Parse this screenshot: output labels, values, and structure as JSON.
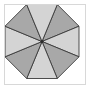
{
  "figure": {
    "canvas": {
      "width": 92,
      "height": 91,
      "background": "#ffffff"
    },
    "frame": {
      "label": "figure border",
      "x": 4,
      "y": 4,
      "width": 82,
      "height": 81,
      "stroke": "#d8d8d8",
      "fill": "#ffffff"
    },
    "palette": {
      "light_fill": "#d4d4d4",
      "dark_fill": "#a8a8a8",
      "outline": "#3a3a3a",
      "center_dot": "#2b2b2b",
      "frame_stroke": "#d8d8d8",
      "background": "#ffffff"
    },
    "shape": {
      "kind": "regular-octagon",
      "sides": 8,
      "center": {
        "x": 41,
        "y": 40.5
      },
      "radius": 40,
      "rotation_deg": 22.5,
      "vertices": [
        {
          "x": 56.3,
          "y": 3.5
        },
        {
          "x": 78.0,
          "y": 25.2
        },
        {
          "x": 78.0,
          "y": 55.8
        },
        {
          "x": 56.3,
          "y": 77.5
        },
        {
          "x": 25.7,
          "y": 77.5
        },
        {
          "x": 4.0,
          "y": 55.8
        },
        {
          "x": 4.0,
          "y": 25.2
        },
        {
          "x": 25.7,
          "y": 3.5
        }
      ],
      "center_dot_radius": 1.6
    },
    "wedges": [
      {
        "name": "wedge-top-right",
        "index": 0,
        "from_vertex": 0,
        "to_vertex": 1,
        "fill": "#a8a8a8",
        "tone": "dark"
      },
      {
        "name": "wedge-right-upper",
        "index": 1,
        "from_vertex": 1,
        "to_vertex": 2,
        "fill": "#d4d4d4",
        "tone": "light"
      },
      {
        "name": "wedge-right-lower",
        "index": 2,
        "from_vertex": 2,
        "to_vertex": 3,
        "fill": "#a8a8a8",
        "tone": "dark"
      },
      {
        "name": "wedge-bottom-right",
        "index": 3,
        "from_vertex": 3,
        "to_vertex": 4,
        "fill": "#d4d4d4",
        "tone": "light"
      },
      {
        "name": "wedge-bottom-left",
        "index": 4,
        "from_vertex": 4,
        "to_vertex": 5,
        "fill": "#a8a8a8",
        "tone": "dark"
      },
      {
        "name": "wedge-left-lower",
        "index": 5,
        "from_vertex": 5,
        "to_vertex": 6,
        "fill": "#d4d4d4",
        "tone": "light"
      },
      {
        "name": "wedge-left-upper",
        "index": 6,
        "from_vertex": 6,
        "to_vertex": 7,
        "fill": "#a8a8a8",
        "tone": "dark"
      },
      {
        "name": "wedge-top-left",
        "index": 7,
        "from_vertex": 7,
        "to_vertex": 0,
        "fill": "#d4d4d4",
        "tone": "light"
      }
    ]
  }
}
